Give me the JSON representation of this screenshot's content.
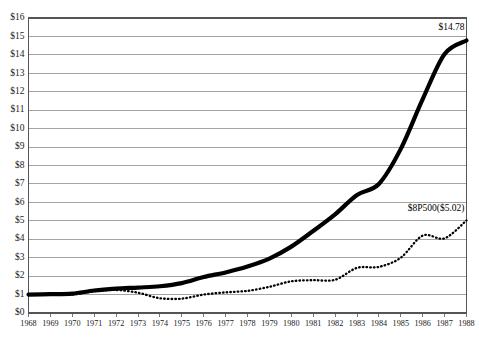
{
  "chart_data": {
    "type": "line",
    "title": "",
    "xlabel": "",
    "ylabel": "",
    "x": [
      1968,
      1969,
      1970,
      1971,
      1972,
      1973,
      1974,
      1975,
      1976,
      1977,
      1978,
      1979,
      1980,
      1981,
      1982,
      1983,
      1984,
      1985,
      1986,
      1987,
      1988
    ],
    "xlim": [
      1968,
      1988
    ],
    "ylim": [
      0,
      16
    ],
    "ytick_step": 1,
    "grid": "horizontal",
    "legend_position": "inline-end-of-line",
    "series": [
      {
        "name": "Fund",
        "style": "solid-bold",
        "end_label": "$14.78",
        "end_value": 14.78,
        "values": [
          1.0,
          1.02,
          1.05,
          1.22,
          1.32,
          1.38,
          1.45,
          1.62,
          1.95,
          2.2,
          2.52,
          2.95,
          3.6,
          4.45,
          5.35,
          6.4,
          7.0,
          8.9,
          11.6,
          14.05,
          14.78
        ]
      },
      {
        "name": "$8P500",
        "style": "dotted",
        "end_label": "$8P500($5.02)",
        "end_value": 5.02,
        "values": [
          1.0,
          0.98,
          1.0,
          1.18,
          1.25,
          1.1,
          0.8,
          0.78,
          1.0,
          1.12,
          1.2,
          1.42,
          1.72,
          1.78,
          1.8,
          2.45,
          2.5,
          3.0,
          4.2,
          4.05,
          5.02
        ]
      }
    ],
    "ytick_labels": [
      "$0",
      "$1",
      "$2",
      "$3",
      "$4",
      "$5",
      "$6",
      "$7",
      "$8",
      "$9",
      "$10",
      "$11",
      "$12",
      "$13",
      "$14",
      "$15",
      "$16"
    ],
    "xtick_labels": [
      "1968",
      "1969",
      "1970",
      "1971",
      "1972",
      "1973",
      "1974",
      "1975",
      "1976",
      "1977",
      "1978",
      "1979",
      "1980",
      "1981",
      "1982",
      "1983",
      "1984",
      "1985",
      "1986",
      "1987",
      "1988"
    ]
  }
}
